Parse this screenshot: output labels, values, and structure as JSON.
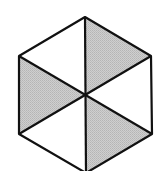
{
  "diagram": {
    "shape": "regular hexagon divided into 6 triangles",
    "total_parts": 6,
    "shaded_parts": 3,
    "colors": {
      "shaded": "#c4c4c4",
      "unshaded": "#ffffff",
      "stroke": "#111111"
    },
    "vertices": {
      "top": [
        85,
        17
      ],
      "upper_right": [
        151,
        56
      ],
      "lower_right": [
        152,
        134
      ],
      "bottom": [
        86,
        173
      ],
      "lower_left": [
        19,
        134
      ],
      "upper_left": [
        19,
        56
      ],
      "center": [
        86,
        96
      ]
    },
    "triangles": [
      {
        "name": "top-left",
        "shaded": false
      },
      {
        "name": "top-right",
        "shaded": true
      },
      {
        "name": "right",
        "shaded": false
      },
      {
        "name": "bottom-right",
        "shaded": true
      },
      {
        "name": "bottom-left",
        "shaded": false
      },
      {
        "name": "left",
        "shaded": true
      }
    ]
  }
}
